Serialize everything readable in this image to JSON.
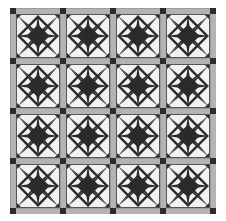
{
  "artwork": {
    "title": "Pinwheel Star Patchwork Quilt",
    "kind": "quilt-pattern",
    "medium": "digital quilt block diagram"
  },
  "canvas": {
    "width": 226,
    "height": 221,
    "background_color": "#ffffff"
  },
  "palette": {
    "background": "#ffffff",
    "dark": "#2b2b2b",
    "light": "#f2f2f2",
    "sashing": "#b3b3b3",
    "sashing_shadow": "#9a9a9a",
    "cornerstone": "#2b2b2b",
    "outline": "#555555"
  },
  "layout": {
    "grid_rows": 4,
    "grid_cols": 4,
    "block_count": 16,
    "quilt_left": 10,
    "quilt_top": 8,
    "quilt_width": 208,
    "quilt_height": 206,
    "sashing_width": 6,
    "cornerstone_size": 6,
    "block_size": 44
  },
  "block": {
    "name": "eight-point-pinwheel-star",
    "units_across": 4,
    "units_down": 4,
    "description": "Central eight pointed star formed of dark rays on light ground with corner triangle units",
    "ray_count": 8,
    "center_color": "#2b2b2b",
    "field_color": "#f2f2f2",
    "ray_color": "#2b2b2b"
  },
  "blocks": [
    {
      "row": 0,
      "col": 0,
      "label": "block-r0-c0"
    },
    {
      "row": 0,
      "col": 1,
      "label": "block-r0-c1"
    },
    {
      "row": 0,
      "col": 2,
      "label": "block-r0-c2"
    },
    {
      "row": 0,
      "col": 3,
      "label": "block-r0-c3"
    },
    {
      "row": 1,
      "col": 0,
      "label": "block-r1-c0"
    },
    {
      "row": 1,
      "col": 1,
      "label": "block-r1-c1"
    },
    {
      "row": 1,
      "col": 2,
      "label": "block-r1-c2"
    },
    {
      "row": 1,
      "col": 3,
      "label": "block-r1-c3"
    },
    {
      "row": 2,
      "col": 0,
      "label": "block-r2-c0"
    },
    {
      "row": 2,
      "col": 1,
      "label": "block-r2-c1"
    },
    {
      "row": 2,
      "col": 2,
      "label": "block-r2-c2"
    },
    {
      "row": 2,
      "col": 3,
      "label": "block-r2-c3"
    },
    {
      "row": 3,
      "col": 0,
      "label": "block-r3-c0"
    },
    {
      "row": 3,
      "col": 1,
      "label": "block-r3-c1"
    },
    {
      "row": 3,
      "col": 2,
      "label": "block-r3-c2"
    },
    {
      "row": 3,
      "col": 3,
      "label": "block-r3-c3"
    }
  ],
  "chart_data": {
    "type": "heatmap",
    "xlabel": "",
    "ylabel": "",
    "categories": [
      "col-1",
      "col-2",
      "col-3",
      "col-4"
    ],
    "rows": [
      "row-1",
      "row-2",
      "row-3",
      "row-4"
    ],
    "values": [
      [
        1,
        1,
        1,
        1
      ],
      [
        1,
        1,
        1,
        1
      ],
      [
        1,
        1,
        1,
        1
      ],
      [
        1,
        1,
        1,
        1
      ]
    ],
    "legend": []
  }
}
